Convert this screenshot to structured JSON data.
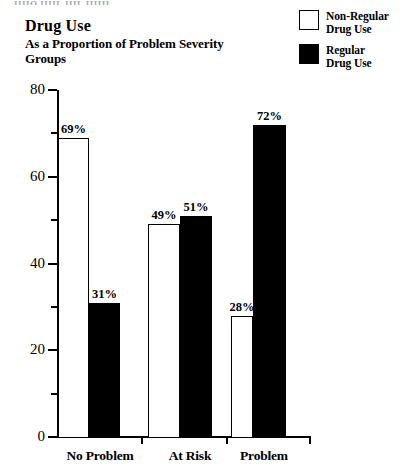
{
  "clipped_header_text": "IIIIO  IIIIL  IIIL  IIIIII",
  "title": "Drug Use",
  "subtitle": "As a Proportion of Problem Severity Groups",
  "legend": {
    "position": "top-right",
    "entries": [
      {
        "label": "Non-Regular Drug Use",
        "line1": "Non-Regular",
        "line2": "Drug Use",
        "swatch": "hollow",
        "color": "#ffffff"
      },
      {
        "label": "Regular Drug Use",
        "line1": "Regular",
        "line2": "Drug Use",
        "swatch": "filled",
        "color": "#000000"
      }
    ]
  },
  "chart_data": {
    "type": "bar",
    "title": "Drug Use",
    "subtitle": "As a Proportion of Problem Severity Groups",
    "xlabel": "",
    "ylabel": "",
    "categories": [
      "No Problem",
      "At Risk",
      "Problem"
    ],
    "series": [
      {
        "name": "Non-Regular Drug Use",
        "color": "#ffffff",
        "values": [
          69,
          31,
          49
        ],
        "value_labels": [
          "69%",
          "31%",
          "49%"
        ]
      },
      {
        "name": "Regular Drug Use",
        "color": "#000000",
        "values": [
          51,
          28,
          72
        ],
        "value_labels": [
          "51%",
          "28%",
          "72%"
        ]
      }
    ],
    "groups": [
      {
        "category": "No Problem",
        "bars": [
          {
            "series": "Non-Regular Drug Use",
            "value": 69,
            "label": "69%",
            "style": "hollow"
          },
          {
            "series": "Regular Drug Use",
            "value": 31,
            "label": "31%",
            "style": "filled"
          }
        ]
      },
      {
        "category": "At Risk",
        "bars": [
          {
            "series": "Non-Regular Drug Use",
            "value": 49,
            "label": "49%",
            "style": "hollow"
          },
          {
            "series": "Regular Drug Use",
            "value": 51,
            "label": "51%",
            "style": "filled"
          }
        ]
      },
      {
        "category": "Problem",
        "bars": [
          {
            "series": "Non-Regular Drug Use",
            "value": 28,
            "label": "28%",
            "style": "hollow"
          },
          {
            "series": "Regular Drug Use",
            "value": 72,
            "label": "72%",
            "style": "filled"
          }
        ]
      }
    ],
    "ylim": [
      0,
      80
    ],
    "ytick_labels": [
      "0",
      "20",
      "40",
      "60",
      "80"
    ],
    "ytick_values": [
      0,
      20,
      40,
      60,
      80
    ],
    "yminor_values": [
      10,
      30,
      50,
      70
    ],
    "grid": false,
    "legend_position": "top-right"
  }
}
